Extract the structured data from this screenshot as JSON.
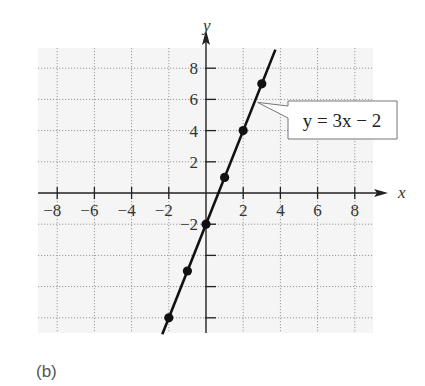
{
  "figure_label": "(b)",
  "chart_data": {
    "type": "line",
    "title": "",
    "xlabel": "x",
    "ylabel": "y",
    "xlim": [
      -9,
      9
    ],
    "ylim": [
      -9,
      9
    ],
    "x_ticks": [
      -8,
      -6,
      -4,
      -2,
      2,
      4,
      6,
      8
    ],
    "y_ticks": [
      8,
      6,
      4,
      2,
      -2,
      -4,
      -6,
      -8
    ],
    "y_tick_labels_shown": [
      8,
      6,
      4,
      2,
      -2
    ],
    "grid": true,
    "grid_style": "dotted",
    "series": [
      {
        "name": "y = 3x - 2",
        "equation": "y = 3x − 2",
        "slope": 3,
        "intercept": -2,
        "points": [
          {
            "x": -2,
            "y": -8
          },
          {
            "x": -1,
            "y": -5
          },
          {
            "x": 0,
            "y": -2
          },
          {
            "x": 1,
            "y": 1
          },
          {
            "x": 2,
            "y": 4
          },
          {
            "x": 3,
            "y": 7
          }
        ],
        "color": "#111111"
      }
    ],
    "annotations": [
      {
        "text": "y = 3x − 2",
        "anchor": {
          "x": 2.67,
          "y": 6
        }
      }
    ],
    "colors": {
      "background": "#f5f5f5",
      "grid": "#9a9a9a",
      "axis": "#222222"
    }
  }
}
